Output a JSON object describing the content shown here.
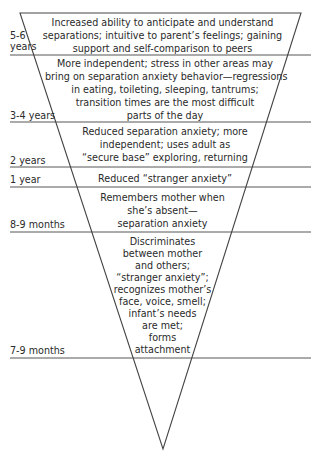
{
  "diagram": {
    "type": "inverted-triangle-stages",
    "line_color": "#444444",
    "text_color": "#2a2a2a",
    "stages": [
      {
        "age": "5-6 years",
        "age_lines": [
          "5-6",
          "years"
        ],
        "description": "Increased ability to anticipate and understand separations; intuitive to parent's feelings; gaining support and self-comparison to peers",
        "lines": [
          "Increased ability to anticipate and understand",
          "separations; intuitive to parent’s feelings; gaining",
          "support and self-comparison to peers"
        ]
      },
      {
        "age": "3-4 years",
        "description": "More independent; stress in other areas may bring on separation anxiety behavior—regressions in eating, toileting, sleeping, tantrums; transition times are the most difficult parts of the day",
        "lines": [
          "More independent; stress in other areas may",
          "bring on separation anxiety behavior—regressions",
          "in eating, toileting, sleeping, tantrums;",
          "transition times are the most difficult",
          "parts of the day"
        ]
      },
      {
        "age": "2 years",
        "description": "Reduced separation anxiety; more independent; uses adult as \"secure base\" exploring, returning",
        "lines": [
          "Reduced separation anxiety; more",
          "independent; uses adult as",
          "“secure base” exploring, returning"
        ]
      },
      {
        "age": "1 year",
        "description": "Reduced \"stranger anxiety\"",
        "lines": [
          "Reduced “stranger anxiety”"
        ]
      },
      {
        "age": "8-9 months",
        "description": "Remembers mother when she's absent—separation anxiety",
        "lines": [
          "Remembers mother when",
          "she’s absent—",
          "separation anxiety"
        ]
      },
      {
        "age": "7-9 months",
        "description": "Discriminates between mother and others; \"stranger anxiety\"; recognizes mother's face, voice, smell; infant's needs are met; forms attachment",
        "lines": [
          "Discriminates",
          "between mother",
          "and others;",
          "“stranger anxiety”;",
          "recognizes mother’s",
          "face, voice, smell;",
          "infant’s needs",
          "are met;",
          "forms",
          "attachment"
        ]
      }
    ]
  }
}
